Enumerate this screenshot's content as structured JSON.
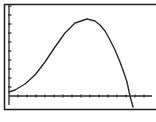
{
  "screen": {
    "type": "graphing-calculator-graph-screen",
    "colors": {
      "background": "#ffffff",
      "ink": "#2b2b2b",
      "frame": "#1e1e1e"
    }
  },
  "chart_data": {
    "type": "line",
    "title": "",
    "xlabel": "",
    "ylabel": "",
    "grid": false,
    "axes": {
      "x_ticks": 16,
      "y_ticks": 10,
      "tick_labels": false
    },
    "series": [
      {
        "name": "Y1",
        "shape": "rises from near zero at left, peaks around 70% of height near 55% of width, then drops steeply crossing the x-axis near 88% of width",
        "points_px": [
          [
            9,
            92
          ],
          [
            15,
            90
          ],
          [
            25,
            84
          ],
          [
            35,
            75
          ],
          [
            45,
            62
          ],
          [
            55,
            47
          ],
          [
            65,
            33
          ],
          [
            75,
            23
          ],
          [
            87,
            19
          ],
          [
            95,
            21
          ],
          [
            100,
            25
          ],
          [
            105,
            31
          ],
          [
            110,
            40
          ],
          [
            115,
            50
          ],
          [
            120,
            62
          ],
          [
            124,
            73
          ],
          [
            127,
            82
          ],
          [
            130,
            96
          ],
          [
            133,
            107
          ]
        ]
      }
    ],
    "x_intercept_px": 130
  }
}
